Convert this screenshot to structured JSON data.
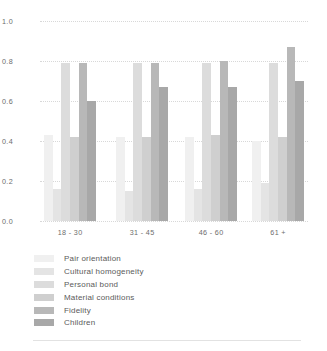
{
  "chart_data": {
    "type": "bar",
    "title": "",
    "xlabel": "",
    "ylabel": "",
    "categories": [
      "18 - 30",
      "31 - 45",
      "46 - 60",
      "61 +"
    ],
    "ylim": [
      0.0,
      1.0
    ],
    "yticks": [
      "1.0",
      "0.8",
      "0.6",
      "0.4",
      "0.2",
      "0.0"
    ],
    "ytick_values": [
      1.0,
      0.8,
      0.6,
      0.4,
      0.2,
      0.0
    ],
    "grid": true,
    "legend_position": "below",
    "series": [
      {
        "name": "Pair orientation",
        "color": "#f0f0f0",
        "values": [
          0.43,
          0.42,
          0.42,
          0.4
        ]
      },
      {
        "name": "Cultural homogeneity",
        "color": "#e4e4e4",
        "values": [
          0.16,
          0.15,
          0.16,
          0.19
        ]
      },
      {
        "name": "Personal bond",
        "color": "#dcdcdc",
        "values": [
          0.79,
          0.79,
          0.79,
          0.79
        ]
      },
      {
        "name": "Material conditions",
        "color": "#cfcfcf",
        "values": [
          0.42,
          0.42,
          0.43,
          0.42
        ]
      },
      {
        "name": "Fidelity",
        "color": "#b8b8b8",
        "values": [
          0.79,
          0.79,
          0.8,
          0.87
        ]
      },
      {
        "name": "Children",
        "color": "#a8a8a8",
        "values": [
          0.6,
          0.67,
          0.67,
          0.7
        ]
      }
    ]
  }
}
